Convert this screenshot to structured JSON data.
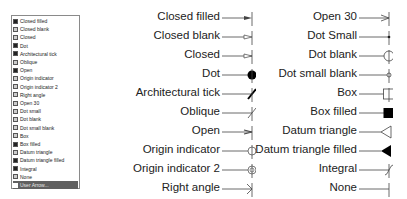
{
  "list": {
    "items": [
      {
        "label": "Closed filled",
        "icon": "closed-filled"
      },
      {
        "label": "Closed blank",
        "icon": "closed-blank"
      },
      {
        "label": "Closed",
        "icon": "closed"
      },
      {
        "label": "Dot",
        "icon": "dot"
      },
      {
        "label": "Architectural tick",
        "icon": "architectural-tick"
      },
      {
        "label": "Oblique",
        "icon": "oblique"
      },
      {
        "label": "Open",
        "icon": "open"
      },
      {
        "label": "Origin indicator",
        "icon": "origin-indicator"
      },
      {
        "label": "Origin indicator 2",
        "icon": "origin-indicator-2"
      },
      {
        "label": "Right angle",
        "icon": "right-angle"
      },
      {
        "label": "Open 30",
        "icon": "open-30"
      },
      {
        "label": "Dot small",
        "icon": "dot-small"
      },
      {
        "label": "Dot blank",
        "icon": "dot-blank"
      },
      {
        "label": "Dot small blank",
        "icon": "dot-small-blank"
      },
      {
        "label": "Box",
        "icon": "box"
      },
      {
        "label": "Box filled",
        "icon": "box-filled"
      },
      {
        "label": "Datum triangle",
        "icon": "datum-triangle"
      },
      {
        "label": "Datum triangle filled",
        "icon": "datum-triangle-filled"
      },
      {
        "label": "Integral",
        "icon": "integral"
      },
      {
        "label": "None",
        "icon": "none"
      },
      {
        "label": "User Arrow...",
        "icon": "user-arrow",
        "selected": true
      }
    ]
  },
  "left_column": [
    {
      "label": "Closed filled",
      "symbol": "closed-filled"
    },
    {
      "label": "Closed blank",
      "symbol": "closed-blank"
    },
    {
      "label": "Closed",
      "symbol": "closed"
    },
    {
      "label": "Dot",
      "symbol": "dot"
    },
    {
      "label": "Architectural tick",
      "symbol": "architectural-tick"
    },
    {
      "label": "Oblique",
      "symbol": "oblique"
    },
    {
      "label": "Open",
      "symbol": "open"
    },
    {
      "label": "Origin indicator",
      "symbol": "origin-indicator"
    },
    {
      "label": "Origin indicator 2",
      "symbol": "origin-indicator-2"
    },
    {
      "label": "Right angle",
      "symbol": "right-angle"
    }
  ],
  "right_column": [
    {
      "label": "Open 30",
      "symbol": "open-30"
    },
    {
      "label": "Dot Small",
      "symbol": "dot-small"
    },
    {
      "label": "Dot blank",
      "symbol": "dot-blank"
    },
    {
      "label": "Dot small blank",
      "symbol": "dot-small-blank"
    },
    {
      "label": "Box",
      "symbol": "box"
    },
    {
      "label": "Box filled",
      "symbol": "box-filled"
    },
    {
      "label": "Datum triangle",
      "symbol": "datum-triangle"
    },
    {
      "label": "Datum triangle filled",
      "symbol": "datum-triangle-filled"
    },
    {
      "label": "Integral",
      "symbol": "integral"
    },
    {
      "label": "None",
      "symbol": "none"
    }
  ],
  "colors": {
    "selection": "#606060",
    "line": "#555555",
    "text": "#222222"
  }
}
